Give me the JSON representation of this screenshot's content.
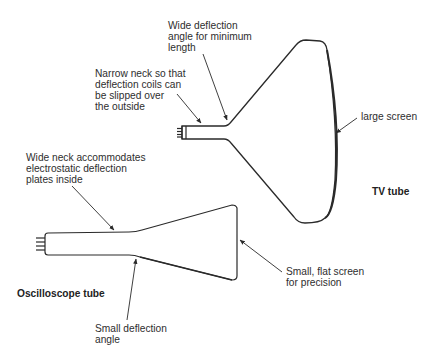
{
  "diagram": {
    "tubes": [
      {
        "id": "tv",
        "title": "TV tube",
        "annotations": {
          "deflection_angle": "Wide deflection\nangle for minimum\nlength",
          "neck": "Narrow neck so that\ndeflection coils can\nbe slipped over\nthe outside",
          "screen": "large screen"
        }
      },
      {
        "id": "oscilloscope",
        "title": "Oscilloscope tube",
        "annotations": {
          "neck": "Wide neck accommodates\nelectrostatic deflection\nplates inside",
          "deflection_angle": "Small deflection\nangle",
          "screen": "Small, flat screen\nfor precision"
        }
      }
    ],
    "colors": {
      "line": "#2a2a2a",
      "background": "#ffffff"
    }
  }
}
